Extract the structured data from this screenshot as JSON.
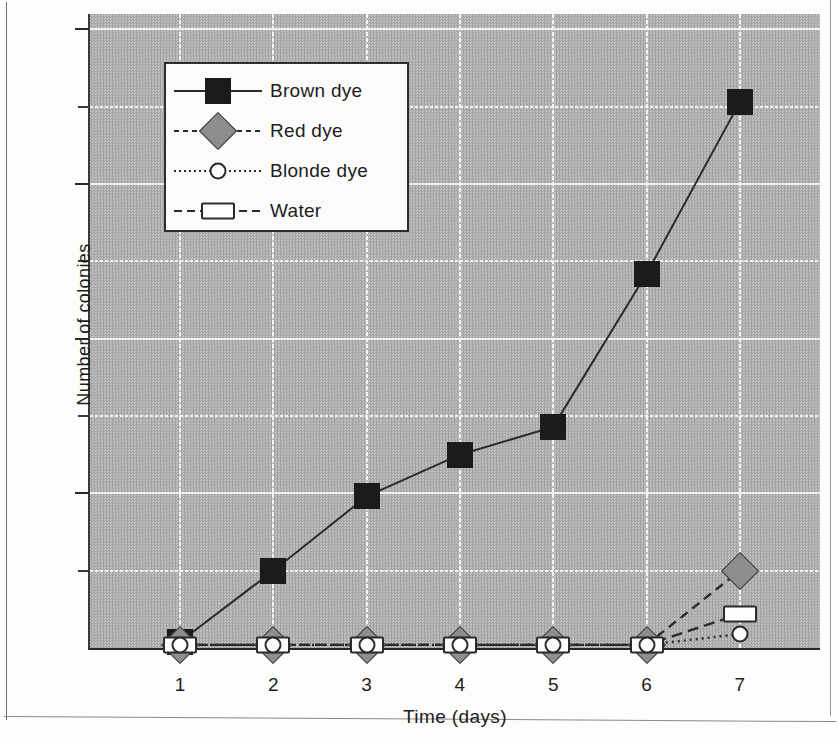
{
  "chart_data": {
    "type": "line",
    "title": "",
    "xlabel": "Time (days)",
    "ylabel": "Number of colonies",
    "x": [
      1,
      2,
      3,
      4,
      5,
      6,
      7
    ],
    "xtick_labels": [
      "1",
      "2",
      "3",
      "4",
      "5",
      "6",
      "7"
    ],
    "ytick_labels": [
      "10",
      "20",
      "30",
      "40"
    ],
    "ytick_values": [
      10,
      20,
      30,
      40
    ],
    "yminor_values": [
      5,
      15,
      25,
      35
    ],
    "ylim": [
      0,
      41
    ],
    "xlim": [
      0.5,
      7.4
    ],
    "grid": true,
    "legend_position": "upper-left-inside",
    "series": [
      {
        "name": "Brown dye",
        "marker": "filled-square",
        "color": "#1b1b1b",
        "linestyle": "solid",
        "values": [
          0.4,
          5.0,
          9.8,
          12.5,
          14.3,
          24.2,
          35.3
        ]
      },
      {
        "name": "Red dye",
        "marker": "gray-diamond",
        "color": "#8d8d8d",
        "linestyle": "dashed",
        "values": [
          0.2,
          0.2,
          0.2,
          0.2,
          0.2,
          0.2,
          5.0
        ]
      },
      {
        "name": "Blonde dye",
        "marker": "open-circle",
        "color": "#fdfdfd",
        "linestyle": "dotted",
        "values": [
          0.2,
          0.2,
          0.2,
          0.2,
          0.2,
          0.2,
          0.9
        ]
      },
      {
        "name": "Water",
        "marker": "open-rectangle",
        "color": "#fdfdfd",
        "linestyle": "long-dash",
        "values": [
          0.2,
          0.2,
          0.2,
          0.2,
          0.2,
          0.2,
          2.2
        ]
      }
    ]
  },
  "legend": {
    "entries": [
      {
        "label": "Brown dye",
        "marker_name": "filled-square-marker",
        "line_class": "line-solid",
        "marker_class": "sq-brown"
      },
      {
        "label": "Red dye",
        "marker_name": "gray-diamond-marker",
        "line_class": "line-dash",
        "marker_class": "di-red"
      },
      {
        "label": "Blonde dye",
        "marker_name": "open-circle-marker",
        "line_class": "line-dot",
        "marker_class": "ci-blonde"
      },
      {
        "label": "Water",
        "marker_name": "open-rectangle-marker",
        "line_class": "line-dashlong",
        "marker_class": "rect-water"
      }
    ]
  },
  "colors": {
    "plot_background": "#b3b3b3",
    "gridline": "#f2f2f2",
    "axis": "#2b2b2b",
    "brown_dye": "#1b1b1b",
    "red_dye": "#8d8d8d",
    "page_background": "#fdfdfc"
  }
}
